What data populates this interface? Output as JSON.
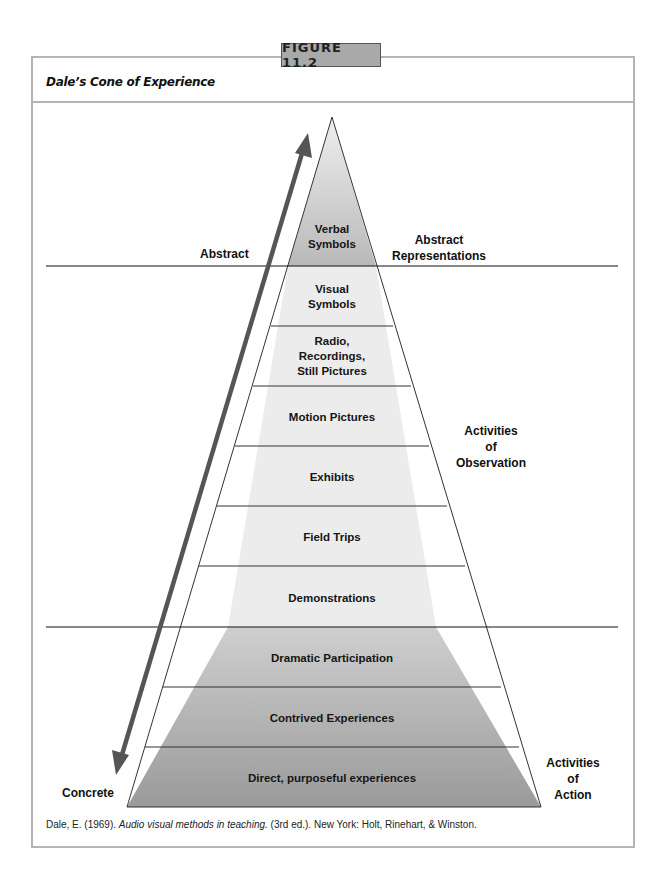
{
  "figure": {
    "tab_label": "FIGURE 11.2",
    "title": "Dale’s Cone of Experience"
  },
  "cone": {
    "layers": [
      {
        "label": "Verbal Symbols",
        "lines": [
          "Verbal",
          "Symbols"
        ],
        "group": "abstract"
      },
      {
        "label": "Visual Symbols",
        "lines": [
          "Visual",
          "Symbols"
        ],
        "group": "observation"
      },
      {
        "label": "Radio, Recordings, Still Pictures",
        "lines": [
          "Radio,",
          "Recordings,",
          "Still Pictures"
        ],
        "group": "observation"
      },
      {
        "label": "Motion Pictures",
        "lines": [
          "Motion Pictures"
        ],
        "group": "observation"
      },
      {
        "label": "Exhibits",
        "lines": [
          "Exhibits"
        ],
        "group": "observation"
      },
      {
        "label": "Field Trips",
        "lines": [
          "Field Trips"
        ],
        "group": "observation"
      },
      {
        "label": "Demonstrations",
        "lines": [
          "Demonstrations"
        ],
        "group": "observation"
      },
      {
        "label": "Dramatic Participation",
        "lines": [
          "Dramatic Participation"
        ],
        "group": "action"
      },
      {
        "label": "Contrived Experiences",
        "lines": [
          "Contrived Experiences"
        ],
        "group": "action"
      },
      {
        "label": "Direct, purposeful experiences",
        "lines": [
          "Direct, purposeful experiences"
        ],
        "group": "action"
      }
    ],
    "colors": {
      "abstract_top": "#efefef",
      "abstract_bottom": "#b9b9b9",
      "observation": "#ececec",
      "action_top": "#cfcfcf",
      "action_bottom": "#9a9a9a",
      "arrow": "#555555",
      "outline": "#333333"
    }
  },
  "side_labels": {
    "abstract": "Abstract",
    "concrete": "Concrete",
    "abstract_representations": [
      "Abstract",
      "Representations"
    ],
    "activities_of_observation": [
      "Activities",
      "of",
      "Observation"
    ],
    "activities_of_action": [
      "Activities",
      "of",
      "Action"
    ]
  },
  "citation": {
    "prefix": "Dale, E. (1969). ",
    "title": "Audio visual methods in teaching.",
    "suffix": " (3rd ed.). New York: Holt, Rinehart, & Winston."
  }
}
